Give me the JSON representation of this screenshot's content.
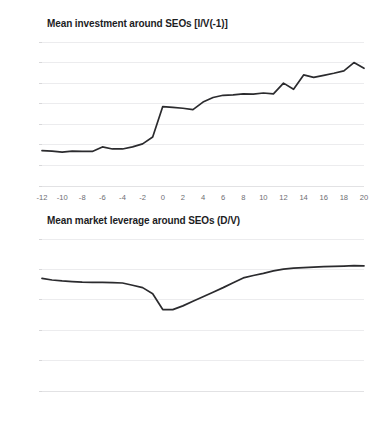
{
  "page": {
    "faint_top_text": "",
    "background_color": "#ffffff",
    "line_color": "#2b2b2e",
    "grid_color": "#ececee",
    "label_color": "#6e6e73",
    "title_color": "#1d1d1f"
  },
  "charts": [
    {
      "id": "investment",
      "title": "Mean investment around SEOs [I/V(-1)]",
      "ylabels": [
        "0.07",
        "0.06",
        "0.05",
        "0.04",
        "0.03",
        "0.02",
        "0.01",
        "0"
      ],
      "xlabels": [
        "-12",
        "-10",
        "-8",
        "-6",
        "-4",
        "-2",
        "0",
        "2",
        "4",
        "6",
        "8",
        "10",
        "12",
        "14",
        "16",
        "18",
        "20"
      ]
    },
    {
      "id": "leverage",
      "title": "Mean market leverage around SEOs (D/V)",
      "ylabels": [
        "0.25",
        "0.2",
        "0.15",
        "0.1",
        "0.05",
        "0"
      ],
      "xlabels": [
        "-12",
        "-10",
        "-8",
        "-6",
        "-4",
        "-2",
        "0",
        "2",
        "4",
        "6",
        "8",
        "10",
        "12",
        "14",
        "16",
        "18",
        "20"
      ]
    }
  ],
  "chart_data": [
    {
      "type": "line",
      "title": "Mean investment around SEOs [I/V(-1)]",
      "xlabel": "",
      "ylabel": "",
      "xlim": [
        -12,
        20
      ],
      "ylim": [
        0,
        0.07
      ],
      "ytick_step": 0.01,
      "xtick_step": 2,
      "grid": true,
      "legend": "none",
      "x": [
        -12,
        -11,
        -10,
        -9,
        -8,
        -7,
        -6,
        -5,
        -4,
        -3,
        -2,
        -1,
        0,
        1,
        2,
        3,
        4,
        5,
        6,
        7,
        8,
        9,
        10,
        11,
        12,
        13,
        14,
        15,
        16,
        17,
        18,
        19,
        20
      ],
      "values": [
        0.0172,
        0.017,
        0.0165,
        0.017,
        0.0168,
        0.0168,
        0.019,
        0.018,
        0.018,
        0.019,
        0.0205,
        0.0238,
        0.0386,
        0.0382,
        0.0378,
        0.0371,
        0.0408,
        0.043,
        0.0441,
        0.0443,
        0.0448,
        0.0447,
        0.0452,
        0.0448,
        0.05,
        0.047,
        0.054,
        0.0528,
        0.0538,
        0.0548,
        0.056,
        0.06,
        0.0572
      ],
      "series": [
        {
          "name": "Mean investment [I/V(-1)]",
          "values": [
            0.0172,
            0.017,
            0.0165,
            0.017,
            0.0168,
            0.0168,
            0.019,
            0.018,
            0.018,
            0.019,
            0.0205,
            0.0238,
            0.0386,
            0.0382,
            0.0378,
            0.0371,
            0.0408,
            0.043,
            0.0441,
            0.0443,
            0.0448,
            0.0447,
            0.0452,
            0.0448,
            0.05,
            0.047,
            0.054,
            0.0528,
            0.0538,
            0.0548,
            0.056,
            0.06,
            0.0572
          ]
        }
      ]
    },
    {
      "type": "line",
      "title": "Mean market leverage around SEOs (D/V)",
      "xlabel": "",
      "ylabel": "",
      "xlim": [
        -12,
        20
      ],
      "ylim": [
        0,
        0.25
      ],
      "ytick_step": 0.05,
      "xtick_step": 2,
      "grid": true,
      "legend": "none",
      "x": [
        -12,
        -11,
        -10,
        -9,
        -8,
        -7,
        -6,
        -5,
        -4,
        -3,
        -2,
        -1,
        0,
        1,
        2,
        3,
        4,
        5,
        6,
        7,
        8,
        9,
        10,
        11,
        12,
        13,
        14,
        15,
        16,
        17,
        18,
        19,
        20
      ],
      "values": [
        0.1852,
        0.1826,
        0.181,
        0.18,
        0.179,
        0.1788,
        0.1788,
        0.1784,
        0.1776,
        0.174,
        0.17,
        0.16,
        0.134,
        0.1338,
        0.14,
        0.1475,
        0.155,
        0.1625,
        0.17,
        0.178,
        0.186,
        0.19,
        0.1935,
        0.1975,
        0.2005,
        0.202,
        0.203,
        0.2038,
        0.2045,
        0.205,
        0.2055,
        0.2062,
        0.2058
      ],
      "series": [
        {
          "name": "Mean market leverage (D/V)",
          "values": [
            0.1852,
            0.1826,
            0.181,
            0.18,
            0.179,
            0.1788,
            0.1788,
            0.1784,
            0.1776,
            0.174,
            0.17,
            0.16,
            0.134,
            0.1338,
            0.14,
            0.1475,
            0.155,
            0.1625,
            0.17,
            0.178,
            0.186,
            0.19,
            0.1935,
            0.1975,
            0.2005,
            0.202,
            0.203,
            0.2038,
            0.2045,
            0.205,
            0.2055,
            0.2062,
            0.2058
          ]
        }
      ]
    }
  ]
}
